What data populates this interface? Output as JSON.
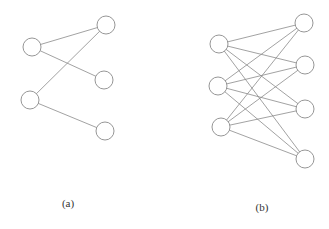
{
  "diagram": {
    "type": "bipartite-graphs",
    "node_radius": 9,
    "colors": {
      "stroke": "#8a8a8a",
      "fill": "#ffffff",
      "text": "#333333"
    },
    "graphs": [
      {
        "id": "a",
        "caption": "(a)",
        "caption_pos": [
          68,
          207
        ],
        "left_nodes": [
          [
            32,
            47
          ],
          [
            30,
            100
          ]
        ],
        "right_nodes": [
          [
            106,
            25
          ],
          [
            104,
            80
          ],
          [
            105,
            131
          ]
        ],
        "edges": [
          [
            0,
            0
          ],
          [
            0,
            1
          ],
          [
            1,
            0
          ],
          [
            1,
            2
          ]
        ]
      },
      {
        "id": "b",
        "caption": "(b)",
        "caption_pos": [
          262,
          211
        ],
        "left_nodes": [
          [
            219,
            44
          ],
          [
            218,
            86
          ],
          [
            221,
            127
          ]
        ],
        "right_nodes": [
          [
            304,
            23
          ],
          [
            305,
            65
          ],
          [
            305,
            109
          ],
          [
            305,
            159
          ]
        ],
        "edges": [
          [
            0,
            0
          ],
          [
            0,
            1
          ],
          [
            0,
            2
          ],
          [
            0,
            3
          ],
          [
            1,
            0
          ],
          [
            1,
            1
          ],
          [
            1,
            2
          ],
          [
            1,
            3
          ],
          [
            2,
            0
          ],
          [
            2,
            1
          ],
          [
            2,
            2
          ],
          [
            2,
            3
          ]
        ]
      }
    ]
  }
}
